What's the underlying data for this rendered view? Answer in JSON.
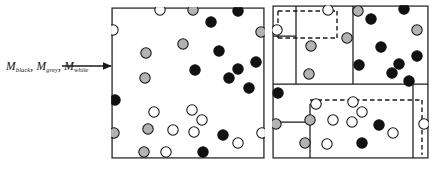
{
  "figure": {
    "title_label": "M black , M grey , M white",
    "annotation": {
      "name": "mass-fraction-label",
      "symbol": "M",
      "subscripts": [
        "black",
        "grey",
        "white"
      ],
      "separator": ","
    },
    "arrow": {
      "name": "pointer-arrow",
      "from_x": 62,
      "from_y": 66,
      "to_x": 112,
      "to_y": 66,
      "color": "#1a1a1a"
    },
    "colors": {
      "black_particle": "#111111",
      "grey_particle": "#b3b3b3",
      "white_particle": "#ffffff",
      "particle_outline": "#111111",
      "box_outline": "#3a3a3a",
      "solid_partition": "#1a1a1a",
      "dashed_partition": "#1a1a1a",
      "background": "#ffffff"
    },
    "particle_radius": 5.2,
    "panels": [
      {
        "name": "left-panel-unpartitioned",
        "box": {
          "x": 112,
          "y": 8,
          "w": 152,
          "h": 150
        },
        "partitions_solid": [],
        "partitions_dashed": [],
        "particles": [
          {
            "x": 160,
            "y": 10,
            "color": "white"
          },
          {
            "x": 193,
            "y": 10,
            "color": "grey"
          },
          {
            "x": 238,
            "y": 11,
            "color": "black"
          },
          {
            "x": 113,
            "y": 30,
            "color": "white"
          },
          {
            "x": 211,
            "y": 22,
            "color": "black"
          },
          {
            "x": 261,
            "y": 32,
            "color": "grey"
          },
          {
            "x": 183,
            "y": 44,
            "color": "grey"
          },
          {
            "x": 146,
            "y": 53,
            "color": "grey"
          },
          {
            "x": 219,
            "y": 51,
            "color": "black"
          },
          {
            "x": 256,
            "y": 62,
            "color": "black"
          },
          {
            "x": 195,
            "y": 70,
            "color": "black"
          },
          {
            "x": 238,
            "y": 69,
            "color": "black"
          },
          {
            "x": 145,
            "y": 78,
            "color": "grey"
          },
          {
            "x": 229,
            "y": 78,
            "color": "black"
          },
          {
            "x": 249,
            "y": 88,
            "color": "black"
          },
          {
            "x": 115,
            "y": 100,
            "color": "black"
          },
          {
            "x": 154,
            "y": 112,
            "color": "white"
          },
          {
            "x": 192,
            "y": 110,
            "color": "white"
          },
          {
            "x": 202,
            "y": 120,
            "color": "white"
          },
          {
            "x": 148,
            "y": 129,
            "color": "grey"
          },
          {
            "x": 173,
            "y": 130,
            "color": "white"
          },
          {
            "x": 194,
            "y": 132,
            "color": "white"
          },
          {
            "x": 114,
            "y": 133,
            "color": "grey"
          },
          {
            "x": 223,
            "y": 135,
            "color": "black"
          },
          {
            "x": 262,
            "y": 133,
            "color": "white"
          },
          {
            "x": 238,
            "y": 143,
            "color": "white"
          },
          {
            "x": 144,
            "y": 152,
            "color": "grey"
          },
          {
            "x": 166,
            "y": 152,
            "color": "white"
          },
          {
            "x": 203,
            "y": 152,
            "color": "black"
          }
        ]
      },
      {
        "name": "right-panel-partitioned",
        "box": {
          "x": 273,
          "y": 6,
          "w": 155,
          "h": 152
        },
        "partitions_solid": [
          {
            "x1": 273,
            "y1": 84,
            "x2": 428,
            "y2": 84
          },
          {
            "x1": 353,
            "y1": 6,
            "x2": 353,
            "y2": 84
          },
          {
            "x1": 296,
            "y1": 6,
            "x2": 296,
            "y2": 84
          },
          {
            "x1": 273,
            "y1": 36,
            "x2": 296,
            "y2": 36
          },
          {
            "x1": 413,
            "y1": 84,
            "x2": 413,
            "y2": 158
          },
          {
            "x1": 310,
            "y1": 104,
            "x2": 310,
            "y2": 158
          },
          {
            "x1": 273,
            "y1": 122,
            "x2": 310,
            "y2": 122
          }
        ],
        "partitions_dashed": [
          {
            "x1": 278,
            "y1": 11,
            "x2": 337,
            "y2": 11
          },
          {
            "x1": 278,
            "y1": 11,
            "x2": 278,
            "y2": 38
          },
          {
            "x1": 278,
            "y1": 38,
            "x2": 337,
            "y2": 38
          },
          {
            "x1": 337,
            "y1": 11,
            "x2": 337,
            "y2": 38
          },
          {
            "x1": 310,
            "y1": 100,
            "x2": 422,
            "y2": 100
          },
          {
            "x1": 422,
            "y1": 100,
            "x2": 422,
            "y2": 155
          }
        ],
        "particles": [
          {
            "x": 328,
            "y": 10,
            "color": "white"
          },
          {
            "x": 358,
            "y": 11,
            "color": "grey"
          },
          {
            "x": 404,
            "y": 9,
            "color": "black"
          },
          {
            "x": 277,
            "y": 30,
            "color": "white"
          },
          {
            "x": 371,
            "y": 19,
            "color": "black"
          },
          {
            "x": 417,
            "y": 30,
            "color": "grey"
          },
          {
            "x": 347,
            "y": 38,
            "color": "grey"
          },
          {
            "x": 311,
            "y": 46,
            "color": "grey"
          },
          {
            "x": 381,
            "y": 47,
            "color": "black"
          },
          {
            "x": 417,
            "y": 56,
            "color": "black"
          },
          {
            "x": 359,
            "y": 65,
            "color": "black"
          },
          {
            "x": 399,
            "y": 64,
            "color": "black"
          },
          {
            "x": 309,
            "y": 74,
            "color": "grey"
          },
          {
            "x": 392,
            "y": 73,
            "color": "black"
          },
          {
            "x": 409,
            "y": 81,
            "color": "black"
          },
          {
            "x": 278,
            "y": 93,
            "color": "black"
          },
          {
            "x": 316,
            "y": 104,
            "color": "white"
          },
          {
            "x": 353,
            "y": 102,
            "color": "white"
          },
          {
            "x": 362,
            "y": 112,
            "color": "white"
          },
          {
            "x": 310,
            "y": 120,
            "color": "grey"
          },
          {
            "x": 333,
            "y": 120,
            "color": "white"
          },
          {
            "x": 352,
            "y": 122,
            "color": "white"
          },
          {
            "x": 276,
            "y": 124,
            "color": "grey"
          },
          {
            "x": 379,
            "y": 125,
            "color": "black"
          },
          {
            "x": 424,
            "y": 124,
            "color": "white"
          },
          {
            "x": 393,
            "y": 133,
            "color": "white"
          },
          {
            "x": 305,
            "y": 143,
            "color": "grey"
          },
          {
            "x": 327,
            "y": 144,
            "color": "white"
          },
          {
            "x": 362,
            "y": 143,
            "color": "black"
          }
        ]
      }
    ]
  }
}
